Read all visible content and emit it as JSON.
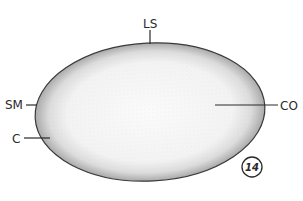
{
  "figure": {
    "number": "14",
    "labels": {
      "ls": "LS",
      "sm": "SM",
      "c": "C",
      "co": "CO"
    },
    "colors": {
      "outline": "#3a3a3a",
      "stipple_dark": "#8a8a8a",
      "fill_light": "#f4f4f4",
      "background": "#ffffff"
    }
  }
}
